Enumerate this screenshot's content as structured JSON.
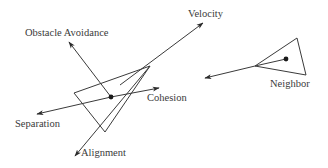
{
  "diagram": {
    "labels": {
      "velocity": "Velocity",
      "obstacle_avoidance": "Obstacle Avoidance",
      "cohesion": "Cohesion",
      "neighbor": "Neighbor",
      "separation": "Separation",
      "alignment": "Alignment"
    },
    "colors": {
      "stroke": "#3a3a3a",
      "text": "#3a3a3a",
      "background": "#ffffff"
    }
  }
}
